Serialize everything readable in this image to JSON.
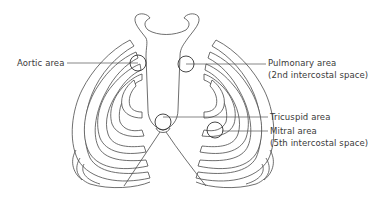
{
  "diagram": {
    "labels": {
      "aortic": {
        "line1": "Aortic area"
      },
      "pulmonary": {
        "line1": "Pulmonary area",
        "line2": "(2nd intercostal space)"
      },
      "tricuspid": {
        "line1": "Tricuspid area"
      },
      "mitral": {
        "line1": "Mitral area",
        "line2": "(5th intercostal space)"
      }
    },
    "areas": [
      {
        "name": "aortic",
        "cx": 138,
        "cy": 63,
        "r": 8
      },
      {
        "name": "pulmonary",
        "cx": 186,
        "cy": 64,
        "r": 8
      },
      {
        "name": "tricuspid",
        "cx": 163,
        "cy": 122,
        "r": 8
      },
      {
        "name": "mitral",
        "cx": 215,
        "cy": 130,
        "r": 8
      }
    ],
    "colors": {
      "line": "#4a4a4a",
      "text": "#3a3a3a",
      "background": "#ffffff"
    }
  }
}
